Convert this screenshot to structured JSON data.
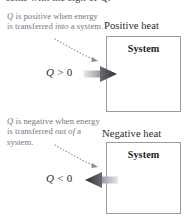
{
  "figure": {
    "cut_off_caption": "sents with  the sign of Q."
  },
  "panels": [
    {
      "id": "positive",
      "heading": "Positive heat",
      "box_label": "System",
      "q_label": "Q > 0",
      "q_symbol": "Q",
      "q_relation": "> 0",
      "note": {
        "lead_symbol": "Q",
        "text_before": " is positive when energy is transferred ",
        "emphasis": "into",
        "text_after": " a system."
      },
      "arrow_direction": "right",
      "arrow_name": "heat-in-arrow"
    },
    {
      "id": "negative",
      "heading": "Negative heat",
      "box_label": "System",
      "q_label": "Q < 0",
      "q_symbol": "Q",
      "q_relation": "< 0",
      "note": {
        "lead_symbol": "Q",
        "text_before": " is negative when energy is transferred ",
        "emphasis": "out of",
        "text_after": " a system."
      },
      "arrow_direction": "left",
      "arrow_name": "heat-out-arrow"
    }
  ],
  "colors": {
    "note_text": "#76767e",
    "heading_text": "#2a2a30",
    "box_border": "#9a9aa4",
    "arrow_head": "#4b4b53",
    "arrow_shaft_light": "#d5d5da",
    "leader_dots": "#8a8a93"
  }
}
